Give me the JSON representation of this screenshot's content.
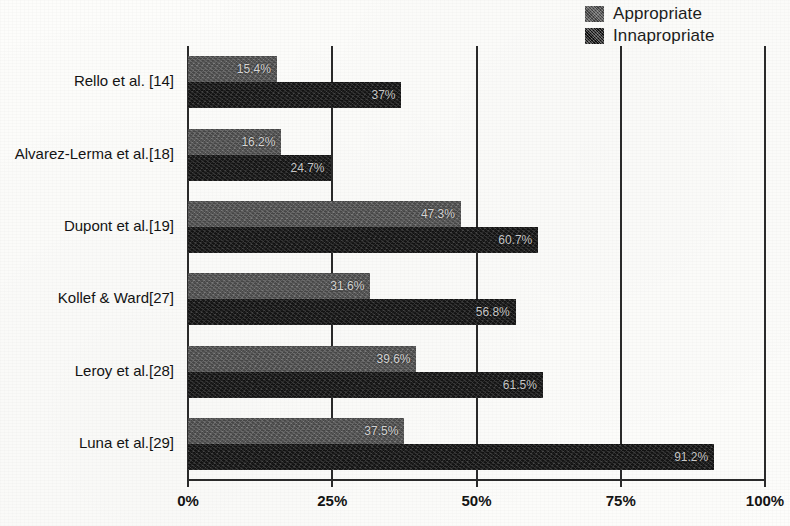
{
  "legend": {
    "position": "top-right",
    "items": [
      {
        "label": "Appropriate",
        "swatch": "legend-swatch-appropriate",
        "color": "#5c5c5c"
      },
      {
        "label": "Innapropriate",
        "swatch": "legend-swatch-innapropriate",
        "color": "#1b1b1b"
      }
    ]
  },
  "axis": {
    "x_ticks": [
      "0%",
      "25%",
      "50%",
      "75%",
      "100%"
    ],
    "x_tick_values": [
      0,
      25,
      50,
      75,
      100
    ]
  },
  "chart_data": {
    "type": "bar",
    "orientation": "horizontal",
    "title": "",
    "subtitle": "",
    "xlabel": "",
    "ylabel": "",
    "xlim": [
      0,
      100
    ],
    "grid": true,
    "grid_axis": "x",
    "legend_position": "top-right",
    "value_suffix": "%",
    "categories": [
      "Rello et al. [14]",
      "Alvarez-Lerma et al.[18]",
      "Dupont et al.[19]",
      "Kollef & Ward[27]",
      "Leroy et al.[28]",
      "Luna et al.[29]"
    ],
    "series": [
      {
        "name": "Appropriate",
        "color": "#5c5c5c",
        "values": [
          15.4,
          16.2,
          47.3,
          31.6,
          39.6,
          37.5
        ],
        "labels": [
          "15.4%",
          "16.2%",
          "47.3%",
          "31.6%",
          "39.6%",
          "37.5%"
        ]
      },
      {
        "name": "Innapropriate",
        "color": "#1b1b1b",
        "values": [
          37.0,
          24.7,
          60.7,
          56.8,
          61.5,
          91.2
        ],
        "labels": [
          "37%",
          "24.7%",
          "60.7%",
          "56.8%",
          "61.5%",
          "91.2%"
        ]
      }
    ]
  }
}
